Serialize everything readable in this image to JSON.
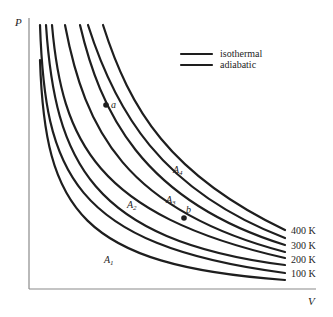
{
  "axes": {
    "y_label": "P",
    "x_label": "V"
  },
  "legend": {
    "items": [
      {
        "label": "isothermal"
      },
      {
        "label": "adiabatic"
      }
    ]
  },
  "isotherms": [
    {
      "label": "400 K",
      "path": "M103,25 C130,110 170,175 285,230"
    },
    {
      "label": "300 K",
      "path": "M80,25 C100,110 140,200 285,245"
    },
    {
      "label": "200 K",
      "path": "M52,25 C62,140 95,215 285,258"
    },
    {
      "label": "100 K",
      "path": "M40,25 C45,170 70,245 285,273"
    }
  ],
  "adiabats": [
    {
      "name": "A4",
      "path": "M88,25 C115,110 160,190 285,238"
    },
    {
      "name": "A3",
      "path": "M65,25 C85,130 125,210 285,252"
    },
    {
      "name": "A2",
      "path": "M46,25 C55,160 90,240 285,265"
    },
    {
      "name": "A1",
      "path": "M40,60 C45,210 80,265 285,280"
    }
  ],
  "points": [
    {
      "name": "a",
      "x": 106,
      "y": 105
    },
    {
      "name": "b",
      "x": 184,
      "y": 218
    }
  ],
  "curve_labels": [
    {
      "text": "A",
      "sub": "4",
      "x": 173,
      "y": 173
    },
    {
      "text": "A",
      "sub": "3",
      "x": 166,
      "y": 203
    },
    {
      "text": "A",
      "sub": "2",
      "x": 127,
      "y": 208
    },
    {
      "text": "A",
      "sub": "1",
      "x": 104,
      "y": 263
    }
  ],
  "temperature_labels": [
    {
      "text": "400 K",
      "x": 291,
      "y": 234
    },
    {
      "text": "300 K",
      "x": 291,
      "y": 249
    },
    {
      "text": "200 K",
      "x": 291,
      "y": 263
    },
    {
      "text": "100 K",
      "x": 291,
      "y": 277
    }
  ]
}
